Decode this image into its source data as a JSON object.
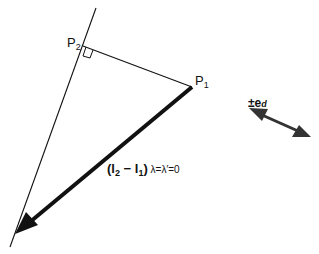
{
  "diagram": {
    "points": {
      "p1": {
        "label": "P",
        "sub": "1"
      },
      "p2": {
        "label": "P",
        "sub": "2"
      }
    },
    "vector_label": {
      "open": "(l",
      "sub_a": "2",
      "minus": " − l",
      "sub_b": "1",
      "close": ")",
      "condition": " λ=λ′=0"
    },
    "direction_label": {
      "prefix": "±e",
      "sub": "d"
    },
    "colors": {
      "line": "#111111",
      "arrow": "#111111",
      "double_arrow": "#333333",
      "background": "#ffffff"
    }
  }
}
